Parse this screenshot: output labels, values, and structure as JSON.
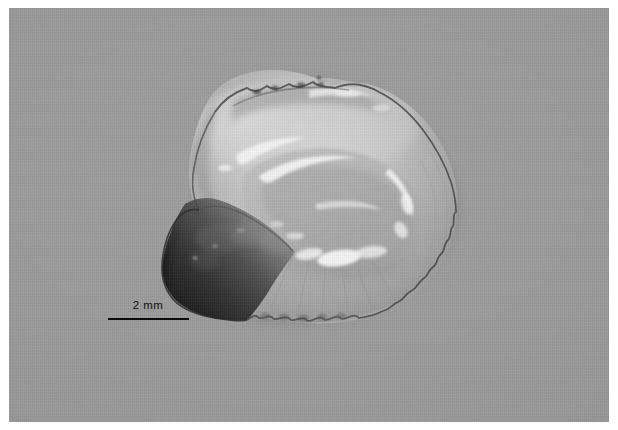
{
  "figure": {
    "kind": "photomicrograph",
    "view": "medial-surface",
    "orientation": "anterior-left",
    "background_color": "#9b9b9b",
    "page_color": "#ffffff",
    "color_mode": "grayscale"
  },
  "plate": {
    "left": 9,
    "top": 8,
    "width": 600,
    "height": 414
  },
  "scalebar": {
    "label": "2 mm",
    "value": 2,
    "unit": "mm",
    "bar_color": "#0c0c0c",
    "text_color": "#111111",
    "bar_length_px": 81,
    "left": 91,
    "top": 290
  },
  "specimen": {
    "bbox": {
      "x": 163,
      "y": 92,
      "width": 294,
      "height": 228
    },
    "features": [
      {
        "name": "dorsal-margin",
        "description": "bumpy crenulated crest with specular highlights"
      },
      {
        "name": "sulcus-acusticus",
        "description": "elongate central groove with bright highlights"
      },
      {
        "name": "rostrum",
        "description": "dark pointed anterior-ventral projection"
      },
      {
        "name": "antirostrum",
        "description": "blunt anterior point"
      },
      {
        "name": "posterior-margin",
        "description": "irregular crenulated outline"
      },
      {
        "name": "ventral-margin",
        "description": "scalloped lobed edge"
      }
    ],
    "tones": {
      "body_light": "#c9c9c9",
      "body_mid": "#a9a9a9",
      "rostrum_dark": "#2e2e2e",
      "highlight": "#f2f2f2",
      "outline": "#3d3d3d"
    }
  }
}
